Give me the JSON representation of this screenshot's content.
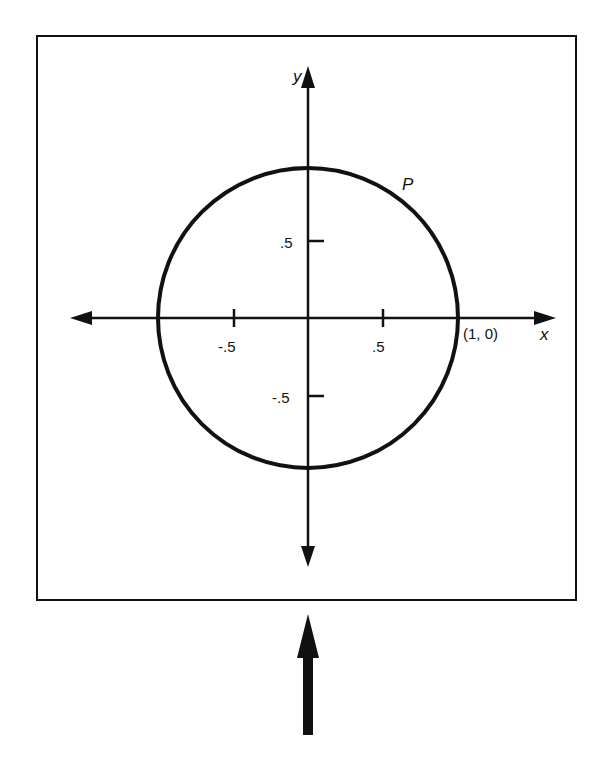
{
  "diagram": {
    "type": "unit-circle",
    "axes": {
      "x_label": "x",
      "y_label": "y"
    },
    "ticks": {
      "x_neg": "-.5",
      "x_pos": ".5",
      "y_pos": ".5",
      "y_neg": "-.5"
    },
    "points": {
      "start_label": "(1, 0)",
      "p_label": "P"
    },
    "colors": {
      "stroke": "#111111",
      "background": "#ffffff"
    }
  }
}
